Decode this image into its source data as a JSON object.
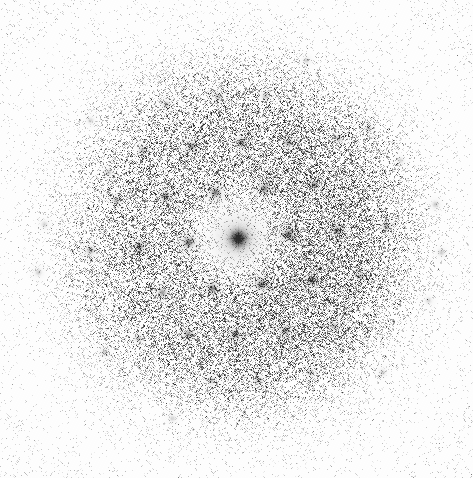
{
  "image": {
    "kind": "diffraction-pattern",
    "title": "Electron diffraction pattern",
    "width": 473,
    "height": 478,
    "background_color": "#ffffff",
    "ink_color": "#2b2b2b",
    "polarity": "dark-spots-on-white",
    "faint_caption": ""
  },
  "chart_data": {
    "type": "scatter",
    "subtitle": "",
    "xlabel": "",
    "ylabel": "",
    "grid": false,
    "legend": "none",
    "xlim": [
      0,
      473
    ],
    "ylim": [
      0,
      478
    ],
    "center": {
      "x": 238,
      "y": 238
    },
    "lattice": {
      "description": "oblique / quasi-hexagonal reciprocal lattice of Bragg reflections",
      "a_vector": {
        "dx": 49.5,
        "dy": -4.0
      },
      "b_vector": {
        "dx": 23.0,
        "dy": 45.5
      },
      "orders_visible": 5,
      "spot_spacing_px": 49.7,
      "rotation_deg": -4.6
    },
    "halo": {
      "description": "diffuse amorphous scattering halo, radially symmetric about the centre",
      "center": {
        "x": 238,
        "y": 238
      },
      "rings_px": [
        70,
        118,
        165
      ],
      "inner_radius_px": 28,
      "outer_radius_px": 210,
      "peak_radius_px": 105
    },
    "grain": {
      "description": "photographic film grain / shot noise over whole frame",
      "density": 0.3,
      "max_opacity": 0.5
    },
    "series": [
      {
        "name": "central beam",
        "points": [
          {
            "x": 238,
            "y": 238,
            "intensity": 1.0,
            "sigma": 5.2
          }
        ]
      },
      {
        "name": "first-order reflections",
        "points": [
          {
            "x": 288,
            "y": 234,
            "intensity": 0.6,
            "sigma": 2.6
          },
          {
            "x": 188,
            "y": 242,
            "intensity": 0.58,
            "sigma": 2.6
          },
          {
            "x": 261,
            "y": 284,
            "intensity": 0.55,
            "sigma": 2.5
          },
          {
            "x": 215,
            "y": 192,
            "intensity": 0.55,
            "sigma": 2.5
          },
          {
            "x": 212,
            "y": 288,
            "intensity": 0.5,
            "sigma": 2.4
          },
          {
            "x": 264,
            "y": 188,
            "intensity": 0.5,
            "sigma": 2.4
          }
        ]
      },
      {
        "name": "second-order reflections",
        "points": [
          {
            "x": 337,
            "y": 230,
            "intensity": 0.45,
            "sigma": 2.3
          },
          {
            "x": 139,
            "y": 246,
            "intensity": 0.45,
            "sigma": 2.3
          },
          {
            "x": 285,
            "y": 330,
            "intensity": 0.42,
            "sigma": 2.2
          },
          {
            "x": 191,
            "y": 146,
            "intensity": 0.42,
            "sigma": 2.2
          },
          {
            "x": 311,
            "y": 280,
            "intensity": 0.48,
            "sigma": 2.4
          },
          {
            "x": 165,
            "y": 196,
            "intensity": 0.44,
            "sigma": 2.3
          },
          {
            "x": 235,
            "y": 334,
            "intensity": 0.46,
            "sigma": 2.3
          },
          {
            "x": 241,
            "y": 142,
            "intensity": 0.44,
            "sigma": 2.3
          },
          {
            "x": 188,
            "y": 334,
            "intensity": 0.4,
            "sigma": 2.2
          },
          {
            "x": 288,
            "y": 142,
            "intensity": 0.4,
            "sigma": 2.2
          },
          {
            "x": 162,
            "y": 292,
            "intensity": 0.4,
            "sigma": 2.2
          },
          {
            "x": 314,
            "y": 184,
            "intensity": 0.4,
            "sigma": 2.2
          }
        ]
      },
      {
        "name": "third-order reflections",
        "points": [
          {
            "x": 386,
            "y": 226,
            "intensity": 0.32,
            "sigma": 2.1
          },
          {
            "x": 90,
            "y": 250,
            "intensity": 0.32,
            "sigma": 2.1
          },
          {
            "x": 334,
            "y": 326,
            "intensity": 0.3,
            "sigma": 2.0
          },
          {
            "x": 142,
            "y": 150,
            "intensity": 0.3,
            "sigma": 2.0
          },
          {
            "x": 360,
            "y": 276,
            "intensity": 0.3,
            "sigma": 2.0
          },
          {
            "x": 116,
            "y": 200,
            "intensity": 0.3,
            "sigma": 2.0
          },
          {
            "x": 258,
            "y": 380,
            "intensity": 0.28,
            "sigma": 2.0
          },
          {
            "x": 218,
            "y": 96,
            "intensity": 0.28,
            "sigma": 2.0
          },
          {
            "x": 211,
            "y": 380,
            "intensity": 0.26,
            "sigma": 1.9
          },
          {
            "x": 265,
            "y": 96,
            "intensity": 0.26,
            "sigma": 1.9
          },
          {
            "x": 310,
            "y": 372,
            "intensity": 0.26,
            "sigma": 1.9
          },
          {
            "x": 166,
            "y": 104,
            "intensity": 0.26,
            "sigma": 1.9
          },
          {
            "x": 138,
            "y": 338,
            "intensity": 0.26,
            "sigma": 1.9
          },
          {
            "x": 338,
            "y": 138,
            "intensity": 0.26,
            "sigma": 1.9
          }
        ]
      },
      {
        "name": "outer weak reflections",
        "points": [
          {
            "x": 435,
            "y": 204,
            "intensity": 0.22,
            "sigma": 1.8
          },
          {
            "x": 441,
            "y": 252,
            "intensity": 0.2,
            "sigma": 1.8
          },
          {
            "x": 428,
            "y": 300,
            "intensity": 0.18,
            "sigma": 1.7
          },
          {
            "x": 38,
            "y": 272,
            "intensity": 0.2,
            "sigma": 1.8
          },
          {
            "x": 44,
            "y": 224,
            "intensity": 0.18,
            "sigma": 1.7
          },
          {
            "x": 108,
            "y": 172,
            "intensity": 0.22,
            "sigma": 1.8
          },
          {
            "x": 368,
            "y": 128,
            "intensity": 0.2,
            "sigma": 1.8
          },
          {
            "x": 104,
            "y": 352,
            "intensity": 0.2,
            "sigma": 1.8
          },
          {
            "x": 382,
            "y": 372,
            "intensity": 0.18,
            "sigma": 1.7
          },
          {
            "x": 172,
            "y": 418,
            "intensity": 0.18,
            "sigma": 1.7
          },
          {
            "x": 306,
            "y": 60,
            "intensity": 0.18,
            "sigma": 1.7
          },
          {
            "x": 90,
            "y": 120,
            "intensity": 0.16,
            "sigma": 1.7
          },
          {
            "x": 400,
            "y": 160,
            "intensity": 0.16,
            "sigma": 1.7
          }
        ]
      }
    ]
  }
}
